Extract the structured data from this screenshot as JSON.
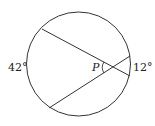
{
  "diagram": {
    "type": "circle-with-intersecting-chords",
    "labels": {
      "left_arc": "42°",
      "right_arc": "12°",
      "point": "P"
    },
    "colors": {
      "stroke": "#333333",
      "background": "#ffffff"
    }
  }
}
